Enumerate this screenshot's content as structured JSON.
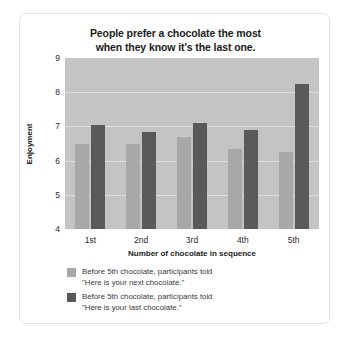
{
  "chart_data": {
    "type": "bar",
    "title": "People prefer a chocolate the most when they know it's the last one.",
    "title_line1": "People prefer a chocolate the most",
    "title_line2": "when they know it's the last one.",
    "xlabel": "Number of chocolate in sequence",
    "ylabel": "Enjoyment",
    "categories": [
      "1st",
      "2nd",
      "3rd",
      "4th",
      "5th"
    ],
    "ylim": [
      4,
      9
    ],
    "yticks": [
      4,
      5,
      6,
      7,
      8,
      9
    ],
    "grid": true,
    "legend_position": "below-left",
    "plot_background": "#c4c4c4",
    "series": [
      {
        "name": "Before 5th chocolate, participants told \"Here is your next chocolate.\"",
        "legend_line1": "Before 5th chocolate, participants told",
        "legend_line2": "\"Here is your next chocolate.\"",
        "color": "#a8a8a8",
        "values": [
          6.5,
          6.5,
          6.7,
          6.35,
          6.25
        ]
      },
      {
        "name": "Before 5th chocolate, participants told \"Here is your last chocolate.\"",
        "legend_line1": "Before 5th chocolate, participants told",
        "legend_line2": "\"Here is your last chocolate.\"",
        "color": "#5a5a5a",
        "values": [
          7.05,
          6.85,
          7.1,
          6.9,
          8.25
        ]
      }
    ]
  }
}
